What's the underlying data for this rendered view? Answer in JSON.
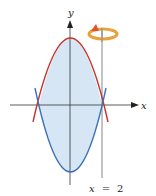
{
  "diagram": {
    "type": "region between two parabolas rotated about a vertical line",
    "axes": {
      "x_label": "x",
      "y_label": "y"
    },
    "curves": [
      {
        "name": "upper-parabola",
        "shape": "downward parabola",
        "color": "#c8322a"
      },
      {
        "name": "lower-parabola",
        "shape": "upward parabola",
        "color": "#3a72b8"
      }
    ],
    "region_fill": "#d6e6f4",
    "axis_of_rotation": {
      "label_var": "x",
      "label_eq": "=",
      "label_val": "2",
      "color": "#888888"
    },
    "rotation_icon": {
      "icon": "rotation-arrow-icon",
      "color": "#e8a23a",
      "arrow_color": "#e0522a"
    }
  }
}
